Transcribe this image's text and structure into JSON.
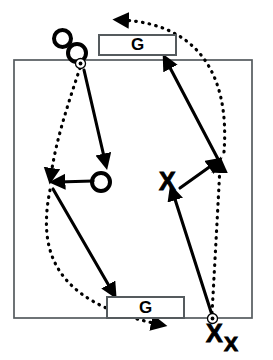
{
  "diagram": {
    "type": "play-diagram",
    "colors": {
      "ink": "#000000",
      "court_line": "#555b5e",
      "goal_border": "#555b5e",
      "background": "#ffffff"
    },
    "court": {
      "label": "court-boundary",
      "x": 14,
      "y": 60,
      "width": 238,
      "height": 258
    },
    "goals": [
      {
        "name": "goal-top",
        "label": "G"
      },
      {
        "name": "goal-bottom",
        "label": "G"
      }
    ],
    "players": [
      {
        "name": "offense-player-1",
        "team": "offense",
        "label": "O",
        "x": 62,
        "y": 38,
        "size": 20
      },
      {
        "name": "offense-player-2",
        "team": "offense",
        "label": "O",
        "x": 76,
        "y": 52,
        "size": 21
      },
      {
        "name": "offense-player-3",
        "team": "offense",
        "label": "O",
        "x": 100,
        "y": 181,
        "size": 21
      },
      {
        "name": "defense-player-1",
        "team": "defense",
        "label": "X",
        "x": 168,
        "y": 181,
        "size": 24
      },
      {
        "name": "defense-player-2",
        "team": "defense",
        "label": "X",
        "x": 215,
        "y": 333,
        "size": 24
      },
      {
        "name": "defense-player-3",
        "team": "defense",
        "label": "X",
        "x": 232,
        "y": 343,
        "size": 20
      }
    ],
    "balls": [
      {
        "name": "ball-marker-top",
        "x": 80,
        "y": 63
      },
      {
        "name": "ball-marker-bottom",
        "x": 212,
        "y": 318
      }
    ],
    "solid_arrows": [
      {
        "name": "pass-arrow-top-to-center-o",
        "from": [
          84,
          70
        ],
        "to": [
          105,
          163
        ]
      },
      {
        "name": "pass-arrow-center-o-to-left",
        "from": [
          93,
          181
        ],
        "to": [
          56,
          182
        ]
      },
      {
        "name": "cut-arrow-left-to-bottom-goal",
        "from": [
          53,
          189
        ],
        "to": [
          113,
          293
        ]
      },
      {
        "name": "run-arrow-right-to-top-goal",
        "from": [
          219,
          161
        ],
        "to": [
          166,
          61
        ]
      },
      {
        "name": "run-arrow-defense-x-to-right",
        "from": [
          180,
          188
        ],
        "to": [
          216,
          162
        ]
      },
      {
        "name": "run-arrow-bottom-ball-to-defense-x",
        "from": [
          212,
          315
        ],
        "to": [
          172,
          191
        ]
      }
    ],
    "dotted_arrows": [
      {
        "name": "dribble-path-top-ball-to-left",
        "kind": "curve",
        "points": [
          80,
          66,
          64,
          120,
          52,
          172
        ],
        "arrow_at": [
          51,
          180
        ]
      },
      {
        "name": "dribble-path-left-to-bottom-right",
        "kind": "curve",
        "points": [
          50,
          188,
          42,
          268,
          118,
          320
        ],
        "arrow_at": [
          163,
          325
        ]
      },
      {
        "name": "dribble-path-bottom-ball-upward",
        "kind": "line",
        "points": [
          212,
          314,
          219,
          168
        ],
        "arrow_at": [
          220,
          160
        ]
      },
      {
        "name": "dribble-path-right-over-top-goal",
        "kind": "curve",
        "points": [
          224,
          152,
          214,
          40,
          130,
          21
        ],
        "arrow_at": [
          116,
          20
        ]
      }
    ]
  }
}
